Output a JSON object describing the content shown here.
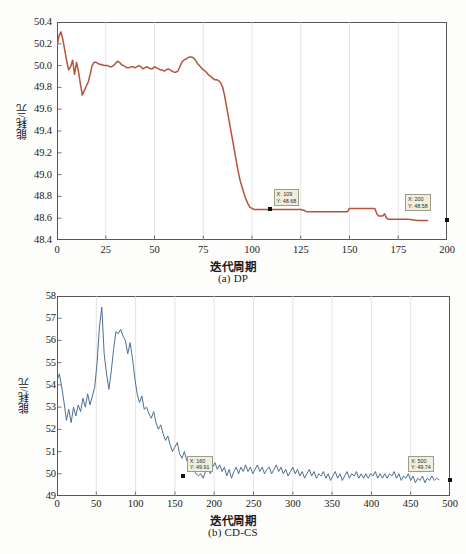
{
  "figure": {
    "panels": [
      {
        "id": "a",
        "caption": "(a) DP",
        "xlabel": "迭代周期",
        "ylabel": "能耗/元"
      },
      {
        "id": "b",
        "caption": "(b) CD-CS",
        "xlabel": "迭代周期",
        "ylabel": "能耗/元"
      }
    ]
  },
  "colors": {
    "series_a": "#b5533c",
    "series_b": "#4d6f92",
    "axis": "#55555a",
    "grid": "#d8d8d8",
    "datatip_bg": "#f0efdd",
    "datatip_border": "#9d9d86",
    "marker": "#111111"
  },
  "chart_data": [
    {
      "type": "line",
      "title": "(a) DP",
      "xlabel": "迭代周期",
      "ylabel": "能耗/元",
      "xlim": [
        0,
        200
      ],
      "ylim": [
        48.4,
        50.4
      ],
      "xticks": [
        0,
        25,
        50,
        75,
        100,
        125,
        150,
        175,
        200
      ],
      "xticklabels": [
        "0",
        "25",
        "50",
        "75",
        "100",
        "125",
        "150",
        "175",
        "200"
      ],
      "yticks": [
        48.4,
        48.6,
        48.8,
        49.0,
        49.2,
        49.4,
        49.6,
        49.8,
        50.0,
        50.2,
        50.4
      ],
      "yticklabels": [
        "48.4",
        "48.6",
        "48.8",
        "49.0",
        "49.2",
        "49.4",
        "49.6",
        "49.8",
        "50.0",
        "50.2",
        "50.4"
      ],
      "grid": "vertical",
      "legend": null,
      "series": [
        {
          "name": "DP",
          "color": "#b5533c",
          "x": [
            0,
            1,
            2,
            3,
            4,
            5,
            6,
            7,
            8,
            9,
            10,
            11,
            12,
            13,
            14,
            15,
            16,
            17,
            18,
            19,
            20,
            21,
            22,
            23,
            24,
            25,
            26,
            27,
            28,
            29,
            30,
            31,
            32,
            33,
            34,
            35,
            36,
            37,
            38,
            39,
            40,
            41,
            42,
            43,
            44,
            45,
            46,
            47,
            48,
            49,
            50,
            51,
            52,
            53,
            54,
            55,
            56,
            57,
            58,
            59,
            60,
            61,
            62,
            63,
            64,
            65,
            66,
            67,
            68,
            69,
            70,
            71,
            72,
            73,
            74,
            75,
            76,
            77,
            78,
            79,
            80,
            81,
            82,
            83,
            84,
            85,
            86,
            87,
            88,
            89,
            90,
            91,
            92,
            93,
            94,
            95,
            96,
            97,
            98,
            99,
            100,
            101,
            102,
            103,
            104,
            105,
            106,
            107,
            108,
            109,
            110,
            115,
            120,
            125,
            127,
            128,
            130,
            135,
            140,
            145,
            149,
            150,
            155,
            158,
            160,
            161,
            162,
            163,
            164,
            165,
            166,
            167,
            168,
            169,
            170,
            171,
            175,
            180,
            185,
            190,
            195,
            200
          ],
          "y": [
            50.18,
            50.27,
            50.31,
            50.24,
            50.14,
            50.04,
            49.96,
            49.99,
            50.05,
            49.92,
            50.03,
            49.95,
            49.83,
            49.73,
            49.77,
            49.81,
            49.85,
            49.92,
            50.0,
            50.03,
            50.03,
            50.02,
            50.01,
            50.01,
            50.0,
            50.0,
            50.0,
            49.99,
            49.99,
            50.0,
            50.02,
            50.04,
            50.03,
            50.01,
            50.0,
            49.99,
            49.98,
            49.98,
            49.99,
            49.99,
            49.98,
            49.99,
            50.0,
            49.99,
            49.97,
            49.98,
            49.99,
            49.98,
            49.97,
            49.97,
            49.99,
            49.98,
            49.97,
            49.96,
            49.96,
            49.95,
            49.96,
            49.97,
            49.96,
            49.95,
            49.94,
            49.94,
            49.95,
            49.99,
            50.03,
            50.05,
            50.06,
            50.07,
            50.08,
            50.08,
            50.07,
            50.05,
            50.02,
            50.0,
            49.98,
            49.96,
            49.95,
            49.93,
            49.91,
            49.9,
            49.88,
            49.87,
            49.87,
            49.86,
            49.84,
            49.8,
            49.72,
            49.62,
            49.52,
            49.42,
            49.32,
            49.22,
            49.12,
            49.02,
            48.94,
            48.88,
            48.82,
            48.77,
            48.73,
            48.7,
            48.69,
            48.68,
            48.68,
            48.68,
            48.68,
            48.68,
            48.68,
            48.68,
            48.68,
            48.68,
            48.68,
            48.68,
            48.68,
            48.68,
            48.67,
            48.66,
            48.66,
            48.66,
            48.66,
            48.66,
            48.66,
            48.69,
            48.69,
            48.69,
            48.69,
            48.69,
            48.69,
            48.69,
            48.64,
            48.62,
            48.62,
            48.62,
            48.64,
            48.6,
            48.59,
            48.59,
            48.59,
            48.59,
            48.58,
            48.58
          ]
        }
      ],
      "datatips": [
        {
          "label_x": "X: 109",
          "label_y": "Y: 48.68",
          "x": 109,
          "y": 48.68
        },
        {
          "label_x": "X: 200",
          "label_y": "Y: 48.58",
          "x": 200,
          "y": 48.58
        }
      ]
    },
    {
      "type": "line",
      "title": "(b) CD-CS",
      "xlabel": "迭代周期",
      "ylabel": "能耗/元",
      "xlim": [
        0,
        500
      ],
      "ylim": [
        49,
        58
      ],
      "xticks": [
        0,
        50,
        100,
        150,
        200,
        250,
        300,
        350,
        400,
        450,
        500
      ],
      "xticklabels": [
        "0",
        "50",
        "100",
        "150",
        "200",
        "250",
        "300",
        "350",
        "400",
        "450",
        "500"
      ],
      "yticks": [
        49,
        50,
        51,
        52,
        53,
        54,
        55,
        56,
        57,
        58
      ],
      "yticklabels": [
        "49",
        "50",
        "51",
        "52",
        "53",
        "54",
        "55",
        "56",
        "57",
        "58"
      ],
      "grid": "vertical",
      "legend": null,
      "series": [
        {
          "name": "CD-CS",
          "color": "#4d6f92",
          "x": [
            0,
            3,
            6,
            9,
            12,
            15,
            18,
            21,
            24,
            27,
            30,
            33,
            36,
            39,
            42,
            45,
            48,
            51,
            54,
            57,
            60,
            63,
            66,
            69,
            72,
            75,
            78,
            81,
            84,
            87,
            90,
            93,
            96,
            99,
            102,
            105,
            108,
            111,
            114,
            117,
            120,
            123,
            126,
            129,
            132,
            135,
            138,
            141,
            144,
            147,
            150,
            153,
            156,
            159,
            162,
            165,
            168,
            171,
            174,
            177,
            180,
            183,
            186,
            189,
            192,
            195,
            198,
            201,
            204,
            207,
            210,
            213,
            216,
            219,
            222,
            225,
            228,
            231,
            234,
            237,
            240,
            243,
            246,
            249,
            252,
            255,
            258,
            261,
            264,
            267,
            270,
            273,
            276,
            279,
            282,
            285,
            288,
            291,
            294,
            297,
            300,
            303,
            306,
            309,
            312,
            315,
            318,
            321,
            324,
            327,
            330,
            333,
            336,
            339,
            342,
            345,
            348,
            351,
            354,
            357,
            360,
            363,
            366,
            369,
            372,
            375,
            378,
            381,
            384,
            387,
            390,
            393,
            396,
            399,
            402,
            405,
            408,
            411,
            414,
            417,
            420,
            423,
            426,
            429,
            432,
            435,
            438,
            441,
            444,
            447,
            450,
            453,
            456,
            459,
            462,
            465,
            468,
            471,
            474,
            477,
            480,
            483,
            486,
            489,
            492,
            495,
            498,
            500
          ],
          "y": [
            54.2,
            54.5,
            53.9,
            53.2,
            52.4,
            52.9,
            52.3,
            53.0,
            52.6,
            53.1,
            52.8,
            53.4,
            53.0,
            53.6,
            53.1,
            53.5,
            53.9,
            55.0,
            56.6,
            57.5,
            55.4,
            54.5,
            53.8,
            54.6,
            55.6,
            56.4,
            56.3,
            56.5,
            56.2,
            56.0,
            55.4,
            55.9,
            55.2,
            54.3,
            53.6,
            53.2,
            53.5,
            52.9,
            53.0,
            52.7,
            52.5,
            52.8,
            52.3,
            52.0,
            52.2,
            51.8,
            51.5,
            51.7,
            51.3,
            51.0,
            51.2,
            51.4,
            50.9,
            50.7,
            51.0,
            50.6,
            50.4,
            50.6,
            50.2,
            50.0,
            49.91,
            50.0,
            49.8,
            50.1,
            50.3,
            50.0,
            50.3,
            50.5,
            50.2,
            50.4,
            50.1,
            50.3,
            49.9,
            50.2,
            49.8,
            50.1,
            50.3,
            50.0,
            50.3,
            50.1,
            50.4,
            50.1,
            50.3,
            50.0,
            50.2,
            50.4,
            50.1,
            50.3,
            50.0,
            50.2,
            50.3,
            50.0,
            50.2,
            50.4,
            50.1,
            50.3,
            50.0,
            50.2,
            49.9,
            50.1,
            50.3,
            50.0,
            50.2,
            49.9,
            50.1,
            49.8,
            50.0,
            50.2,
            49.9,
            50.1,
            49.8,
            50.0,
            49.9,
            50.1,
            49.8,
            50.0,
            49.7,
            49.9,
            50.1,
            49.8,
            50.0,
            49.7,
            49.9,
            50.1,
            49.8,
            50.0,
            49.9,
            50.1,
            49.8,
            50.0,
            49.8,
            50.0,
            49.8,
            50.0,
            49.9,
            50.1,
            49.8,
            50.0,
            49.8,
            50.0,
            49.8,
            50.0,
            49.9,
            50.1,
            49.8,
            50.0,
            49.7,
            49.9,
            49.8,
            50.0,
            49.7,
            49.9,
            49.6,
            49.8,
            49.7,
            49.9,
            49.6,
            49.8,
            49.7,
            49.9,
            49.7,
            49.8,
            49.74
          ]
        }
      ],
      "datatips": [
        {
          "label_x": "X: 160",
          "label_y": "Y: 49.91",
          "x": 160,
          "y": 49.91
        },
        {
          "label_x": "X: 500",
          "label_y": "Y: 49.74",
          "x": 500,
          "y": 49.74
        }
      ]
    }
  ]
}
